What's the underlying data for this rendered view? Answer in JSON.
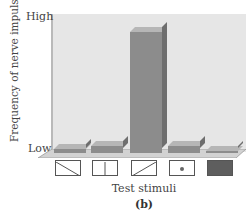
{
  "chart_data": {
    "type": "bar",
    "title": "",
    "xlabel": "Test stimuli",
    "ylabel": "Frequency of nerve impulses",
    "y_ticks": [
      "Low",
      "High"
    ],
    "ylim": [
      0,
      100
    ],
    "grid": false,
    "legend": null,
    "categories": [
      "diagonal line (top-left to bottom-right)",
      "vertical line",
      "diagonal line (bottom-left to top-right)",
      "dot",
      "filled dark square"
    ],
    "values": [
      3,
      6,
      98,
      6,
      1
    ],
    "panel_label": "(b)",
    "style": "3D bars, gray"
  },
  "labels": {
    "y_axis": "Frequency of nerve impulses",
    "y_high": "High",
    "y_low": "Low",
    "x_axis": "Test stimuli",
    "panel": "(b)"
  },
  "colors": {
    "bar_front": "#8c8c8c",
    "bar_top": "#b6b6b6",
    "bar_side": "#6e6e6e",
    "back_wall": "#e6e6e6",
    "stimulus_fill": "#5e5e5e"
  }
}
